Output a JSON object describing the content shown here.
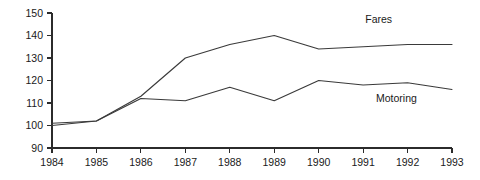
{
  "chart_data": {
    "type": "line",
    "title": "",
    "subtitle": "",
    "xlabel": "",
    "ylabel": "",
    "x": [
      1984,
      1985,
      1986,
      1987,
      1988,
      1989,
      1990,
      1991,
      1992,
      1993
    ],
    "categories": [
      "1984",
      "1985",
      "1986",
      "1987",
      "1988",
      "1989",
      "1990",
      "1991",
      "1992",
      "1993"
    ],
    "xlim": [
      1984,
      1993
    ],
    "ylim": [
      90,
      150
    ],
    "yticks": [
      90,
      100,
      110,
      120,
      130,
      140,
      150
    ],
    "ytick_labels": [
      "90",
      "100",
      "110",
      "120",
      "130",
      "140",
      "150"
    ],
    "grid": false,
    "legend_position": "inline-annotation",
    "series": [
      {
        "name": "Fares",
        "color": "#3a3a3a",
        "values": [
          100,
          102,
          113,
          130,
          136,
          140,
          134,
          135,
          136,
          136
        ],
        "label_x": 1991.35,
        "label_y": 145.5
      },
      {
        "name": "Motoring",
        "color": "#3a3a3a",
        "values": [
          101,
          102,
          112,
          111,
          117,
          111,
          120,
          118,
          119,
          116
        ],
        "label_x": 1991.75,
        "label_y": 110.5
      }
    ],
    "annotations": [
      {
        "text": "Fares",
        "x": 1991.35,
        "y": 145.5
      },
      {
        "text": "Motoring",
        "x": 1991.75,
        "y": 110.5
      }
    ]
  }
}
